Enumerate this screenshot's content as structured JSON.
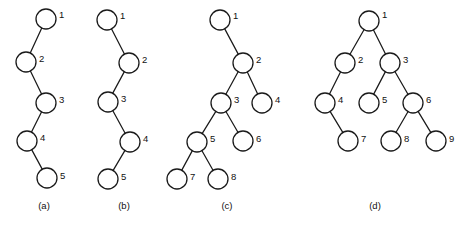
{
  "figure": {
    "width": 463,
    "height": 228,
    "background_color": "#ffffff",
    "stroke_color": "#1a1a1a",
    "node_fill_color": "#ffffff",
    "node_radius": 10,
    "label_color": "#111111"
  },
  "panels": [
    {
      "id": "panel-a",
      "caption": "(a)",
      "caption_x": 44,
      "caption_y": 206,
      "nodes": [
        {
          "label": "1",
          "x": 46,
          "y": 19,
          "label_x": 59,
          "label_y": 15
        },
        {
          "label": "2",
          "x": 26,
          "y": 62,
          "label_x": 39,
          "label_y": 59
        },
        {
          "label": "3",
          "x": 46,
          "y": 103,
          "label_x": 59,
          "label_y": 100
        },
        {
          "label": "4",
          "x": 27,
          "y": 141,
          "label_x": 40,
          "label_y": 138
        },
        {
          "label": "5",
          "x": 47,
          "y": 178,
          "label_x": 60,
          "label_y": 176
        }
      ],
      "edges": [
        {
          "from": "1",
          "to": "2"
        },
        {
          "from": "2",
          "to": "3"
        },
        {
          "from": "3",
          "to": "4"
        },
        {
          "from": "4",
          "to": "5"
        }
      ]
    },
    {
      "id": "panel-b",
      "caption": "(b)",
      "caption_x": 124,
      "caption_y": 206,
      "nodes": [
        {
          "label": "1",
          "x": 107,
          "y": 20,
          "label_x": 120,
          "label_y": 16
        },
        {
          "label": "2",
          "x": 129,
          "y": 63,
          "label_x": 142,
          "label_y": 60
        },
        {
          "label": "3",
          "x": 108,
          "y": 102,
          "label_x": 121,
          "label_y": 99
        },
        {
          "label": "4",
          "x": 130,
          "y": 142,
          "label_x": 143,
          "label_y": 139
        },
        {
          "label": "5",
          "x": 108,
          "y": 179,
          "label_x": 121,
          "label_y": 177
        }
      ],
      "edges": [
        {
          "from": "1",
          "to": "2"
        },
        {
          "from": "2",
          "to": "3"
        },
        {
          "from": "3",
          "to": "4"
        },
        {
          "from": "4",
          "to": "5"
        }
      ]
    },
    {
      "id": "panel-c",
      "caption": "(c)",
      "caption_x": 227,
      "caption_y": 206,
      "nodes": [
        {
          "label": "1",
          "x": 220,
          "y": 20,
          "label_x": 233,
          "label_y": 16
        },
        {
          "label": "2",
          "x": 243,
          "y": 63,
          "label_x": 256,
          "label_y": 60
        },
        {
          "label": "3",
          "x": 221,
          "y": 103,
          "label_x": 234,
          "label_y": 100
        },
        {
          "label": "4",
          "x": 262,
          "y": 103,
          "label_x": 275,
          "label_y": 100
        },
        {
          "label": "5",
          "x": 197,
          "y": 142,
          "label_x": 210,
          "label_y": 139
        },
        {
          "label": "6",
          "x": 243,
          "y": 141,
          "label_x": 256,
          "label_y": 139
        },
        {
          "label": "7",
          "x": 177,
          "y": 179,
          "label_x": 190,
          "label_y": 177
        },
        {
          "label": "8",
          "x": 218,
          "y": 179,
          "label_x": 231,
          "label_y": 177
        }
      ],
      "edges": [
        {
          "from": "1",
          "to": "2"
        },
        {
          "from": "2",
          "to": "3"
        },
        {
          "from": "2",
          "to": "4"
        },
        {
          "from": "3",
          "to": "5"
        },
        {
          "from": "3",
          "to": "6"
        },
        {
          "from": "5",
          "to": "7"
        },
        {
          "from": "5",
          "to": "8"
        }
      ]
    },
    {
      "id": "panel-d",
      "caption": "(d)",
      "caption_x": 375,
      "caption_y": 206,
      "nodes": [
        {
          "label": "1",
          "x": 369,
          "y": 21,
          "label_x": 382,
          "label_y": 15
        },
        {
          "label": "2",
          "x": 345,
          "y": 63,
          "label_x": 358,
          "label_y": 60
        },
        {
          "label": "3",
          "x": 390,
          "y": 63,
          "label_x": 403,
          "label_y": 60
        },
        {
          "label": "4",
          "x": 325,
          "y": 103,
          "label_x": 338,
          "label_y": 100
        },
        {
          "label": "5",
          "x": 369,
          "y": 103,
          "label_x": 382,
          "label_y": 100
        },
        {
          "label": "6",
          "x": 413,
          "y": 103,
          "label_x": 426,
          "label_y": 100
        },
        {
          "label": "7",
          "x": 348,
          "y": 141,
          "label_x": 361,
          "label_y": 139
        },
        {
          "label": "8",
          "x": 391,
          "y": 141,
          "label_x": 404,
          "label_y": 139
        },
        {
          "label": "9",
          "x": 436,
          "y": 141,
          "label_x": 449,
          "label_y": 139
        }
      ],
      "edges": [
        {
          "from": "1",
          "to": "2"
        },
        {
          "from": "1",
          "to": "3"
        },
        {
          "from": "2",
          "to": "4"
        },
        {
          "from": "3",
          "to": "5"
        },
        {
          "from": "3",
          "to": "6"
        },
        {
          "from": "4",
          "to": "7"
        },
        {
          "from": "6",
          "to": "8"
        },
        {
          "from": "6",
          "to": "9"
        }
      ]
    }
  ]
}
